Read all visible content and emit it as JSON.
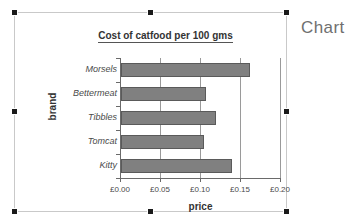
{
  "outside": {
    "label": "Chart"
  },
  "chart_data": {
    "type": "bar",
    "orientation": "horizontal",
    "title": "Cost of catfood per 100 gms",
    "xlabel": "price",
    "ylabel": "brand",
    "categories": [
      "Morsels",
      "Bettermeat",
      "Tibbles",
      "Tomcat",
      "Kitty"
    ],
    "values": [
      0.161,
      0.106,
      0.119,
      0.104,
      0.139
    ],
    "xlim": [
      0.0,
      0.2
    ],
    "xticks": [
      0.0,
      0.05,
      0.1,
      0.15,
      0.2
    ],
    "xticklabels": [
      "£0.00",
      "£0.05",
      "£0.10",
      "£0.15",
      "£0.20"
    ],
    "currency": "£",
    "grid": "vertical",
    "legend": "none",
    "bar_color": "#808080",
    "bar_edge_color": "#5a5a5a",
    "axis_color": "#6a6a6a",
    "gridline_color": "#9a9a9a"
  }
}
